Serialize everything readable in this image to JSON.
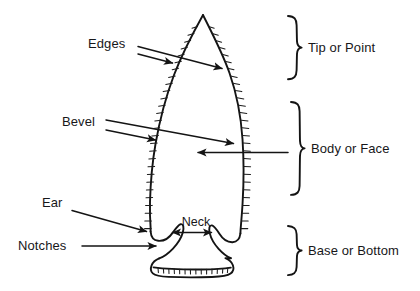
{
  "figure": {
    "background_color": "#ffffff",
    "ink_color": "#141414"
  },
  "labels": {
    "edges": "Edges",
    "bevel": "Bevel",
    "ear": "Ear",
    "notches": "Notches",
    "neck": "Neck",
    "tip_or_point": "Tip or Point",
    "body_or_face": "Body or Face",
    "base_or_bottom": "Base or Bottom"
  },
  "callouts": [
    {
      "id": "edges",
      "label": "Edges",
      "side": "left",
      "arrow_count": 2,
      "targets": [
        "left-edge-upper",
        "right-edge-upper"
      ]
    },
    {
      "id": "bevel",
      "label": "Bevel",
      "side": "left",
      "arrow_count": 2,
      "targets": [
        "left-edge-mid",
        "right-edge-mid"
      ]
    },
    {
      "id": "body-face",
      "label": "Body or Face",
      "side": "right",
      "arrow_count": 1,
      "targets": [
        "face-interior"
      ]
    },
    {
      "id": "ear",
      "label": "Ear",
      "side": "left",
      "arrow_count": 1,
      "targets": [
        "left-ear"
      ]
    },
    {
      "id": "notches",
      "label": "Notches",
      "side": "left",
      "arrow_count": 1,
      "targets": [
        "left-notch"
      ]
    },
    {
      "id": "neck",
      "label": "Neck",
      "side": "center",
      "arrow_count": 2,
      "targets": [
        "neck-left",
        "neck-right"
      ]
    }
  ],
  "braces": [
    {
      "id": "tip",
      "label": "Tip or Point",
      "span_top_px": 28,
      "span_bottom_px": 78
    },
    {
      "id": "body",
      "label": "Body or Face",
      "span_top_px": 102,
      "span_bottom_px": 188
    },
    {
      "id": "base",
      "label": "Base or Bottom",
      "span_top_px": 226,
      "span_bottom_px": 272
    }
  ],
  "icons": {
    "arrow": "arrow-icon",
    "brace": "curly-brace-icon",
    "point_outline": "projectile-point-icon"
  }
}
